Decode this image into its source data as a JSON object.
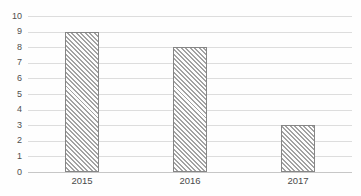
{
  "chart_data": {
    "type": "bar",
    "categories": [
      "2015",
      "2016",
      "2017"
    ],
    "values": [
      9,
      8,
      3
    ],
    "series": [
      {
        "name": "",
        "values": [
          9,
          8,
          3
        ]
      }
    ],
    "title": "",
    "xlabel": "",
    "ylabel": "",
    "ylim": [
      0,
      10
    ],
    "ytick_step": 1,
    "ytick_labels": [
      "0",
      "1",
      "2",
      "3",
      "4",
      "5",
      "6",
      "7",
      "8",
      "9",
      "10"
    ],
    "grid": "horizontal",
    "legend_position": "none",
    "bar_style": "diagonal-hatch",
    "colors": {
      "background": "#fefefe",
      "gridline": "#dddddd",
      "axis_line": "#c7c7c7",
      "bar_border": "#868686",
      "bar_hatch": "#a2a2a2",
      "tick_text": "#4f4f4f"
    }
  }
}
